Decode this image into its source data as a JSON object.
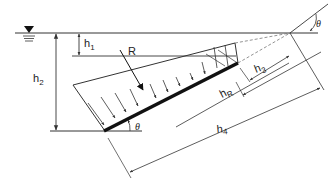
{
  "diagram": {
    "type": "hydrostatic-pressure-on-inclined-plane",
    "colors": {
      "line": "#333333",
      "plate": "#111111",
      "dashed": "#777777"
    },
    "labels": {
      "water_surface_symbol": "▼",
      "h1": {
        "base": "h",
        "sub": "1"
      },
      "h2": {
        "base": "h",
        "sub": "2"
      },
      "h3": {
        "base": "h",
        "sub": "3"
      },
      "hR": {
        "base": "h",
        "sub": "R"
      },
      "h4": {
        "base": "h",
        "sub": "4"
      },
      "R": "R",
      "theta_top": "θ",
      "theta_bottom": "θ"
    }
  }
}
